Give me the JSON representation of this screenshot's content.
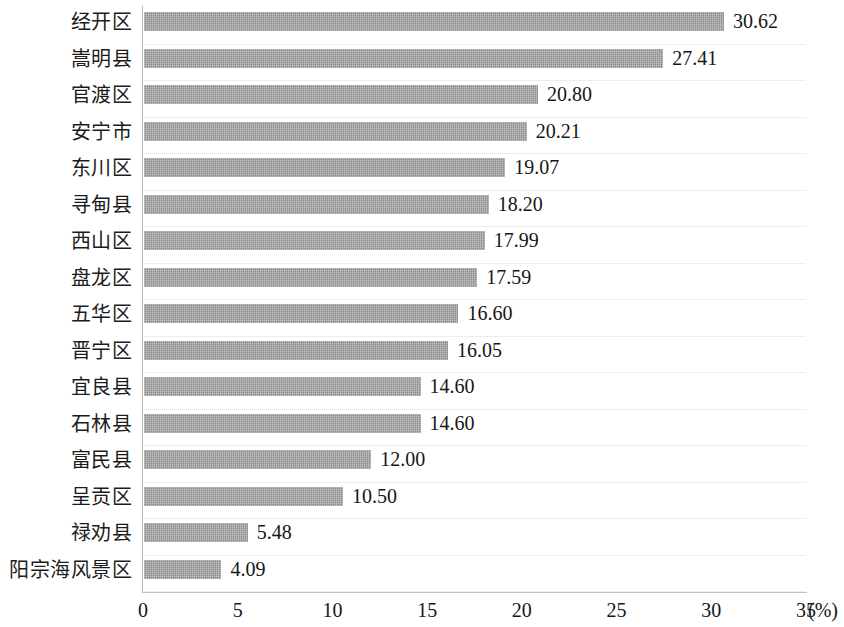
{
  "chart_data": {
    "type": "bar",
    "orientation": "horizontal",
    "title": "",
    "subtitle": "",
    "xlabel": "(%)",
    "ylabel": "",
    "xlim": [
      0,
      35
    ],
    "xticks": [
      "0",
      "5",
      "10",
      "15",
      "20",
      "25",
      "30",
      "35"
    ],
    "xtick_values": [
      0,
      5,
      10,
      15,
      20,
      25,
      30,
      35
    ],
    "grid": true,
    "grid_axis": "y",
    "legend": false,
    "legend_position": "none",
    "bar_color": "#9c9c9c",
    "value_label_format": "0.00",
    "categories": [
      "经开区",
      "嵩明县",
      "官渡区",
      "安宁市",
      "东川区",
      "寻甸县",
      "西山区",
      "盘龙区",
      "五华区",
      "晋宁区",
      "宜良县",
      "石林县",
      "富民县",
      "呈贡区",
      "禄劝县",
      "阳宗海风景区"
    ],
    "values": [
      30.62,
      27.41,
      20.8,
      20.21,
      19.07,
      18.2,
      17.99,
      17.59,
      16.6,
      16.05,
      14.6,
      14.6,
      12.0,
      10.5,
      5.48,
      4.09
    ],
    "value_labels": [
      "30.62",
      "27.41",
      "20.80",
      "20.21",
      "19.07",
      "18.20",
      "17.99",
      "17.59",
      "16.60",
      "16.05",
      "14.60",
      "14.60",
      "12.00",
      "10.50",
      "5.48",
      "4.09"
    ]
  }
}
